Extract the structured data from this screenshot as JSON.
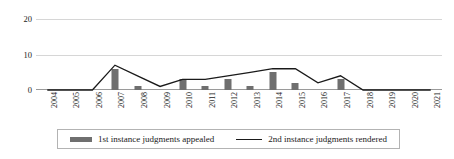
{
  "chart_data": {
    "type": "bar",
    "title": "",
    "xlabel": "",
    "ylabel": "",
    "ylim": [
      0,
      22
    ],
    "yticks": [
      0,
      10,
      20
    ],
    "grid": true,
    "legend_position": "bottom",
    "categories": [
      "2004",
      "2005",
      "2006",
      "2007",
      "2008",
      "2009",
      "2010",
      "2011",
      "2012",
      "2013",
      "2014",
      "2015",
      "2016",
      "2017",
      "2018",
      "2019",
      "2020",
      "2021"
    ],
    "series": [
      {
        "name": "1st instance judgments appealed",
        "type": "bar",
        "color": "#6f6f6f",
        "values": [
          0,
          0,
          0,
          6,
          1,
          0,
          3,
          1,
          3,
          1,
          5,
          2,
          0,
          3,
          0,
          0,
          0,
          0
        ]
      },
      {
        "name": "2nd instance judgments rendered",
        "type": "line",
        "color": "#1a1a1a",
        "values": [
          0,
          0,
          0,
          7,
          4,
          1,
          3,
          3,
          4,
          5,
          6,
          6,
          2,
          4,
          0,
          0,
          0,
          0
        ]
      }
    ]
  },
  "legend": {
    "items": [
      {
        "label": "1st instance judgments appealed",
        "marker": "bar-swatch-icon"
      },
      {
        "label": "2nd instance judgments rendered",
        "marker": "line-swatch-icon"
      }
    ]
  }
}
